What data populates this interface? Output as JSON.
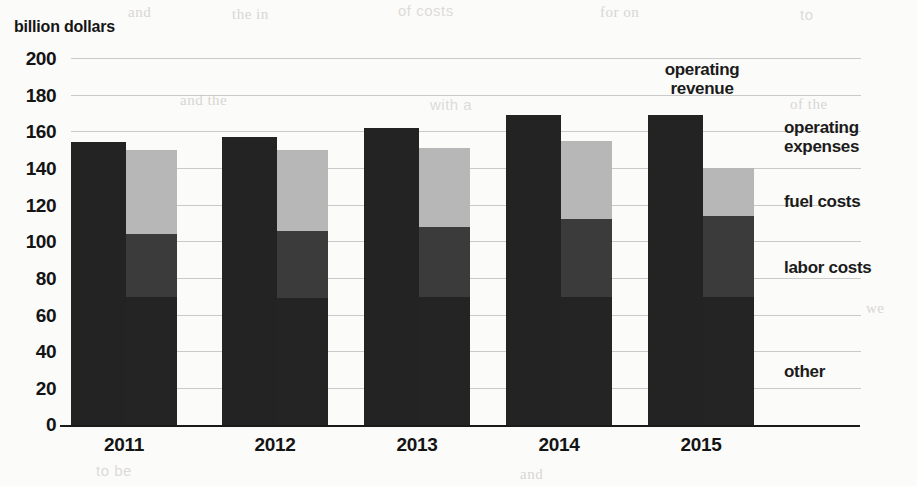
{
  "chart_data": {
    "type": "bar",
    "title": "",
    "subtitle": "",
    "ylabel": "billion dollars",
    "xlabel": "",
    "ylim": [
      0,
      200
    ],
    "ytick_step": 20,
    "yticks": [
      "200",
      "180",
      "160",
      "140",
      "120",
      "100",
      "80",
      "60",
      "40",
      "20",
      "0"
    ],
    "grid": true,
    "legend_position": "right-inline-labels",
    "categories": [
      "2011",
      "2012",
      "2013",
      "2014",
      "2015"
    ],
    "annotations": [
      {
        "text": "operating revenue",
        "line1": "operating",
        "line2": "revenue",
        "target": "2015 revenue bar"
      }
    ],
    "series": [
      {
        "name": "operating revenue",
        "color": "#232323",
        "stacked": false,
        "values": [
          154,
          157,
          162,
          169,
          169
        ]
      },
      {
        "name": "operating expenses",
        "color": "#b7b7b7",
        "stacked": true,
        "total": [
          150,
          150,
          151,
          155,
          140
        ],
        "components": [
          {
            "name": "other",
            "color": "#242424",
            "values": [
              70,
              69,
              70,
              70,
              70
            ]
          },
          {
            "name": "labor costs",
            "color": "#3b3b3b",
            "values": [
              34,
              37,
              38,
              42,
              44
            ]
          },
          {
            "name": "fuel costs",
            "color": "#b7b7b7",
            "values": [
              46,
              44,
              43,
              43,
              26
            ]
          }
        ]
      }
    ],
    "cumulative_tops": {
      "other": [
        70,
        69,
        70,
        70,
        70
      ],
      "labor_costs": [
        104,
        106,
        108,
        112,
        114
      ],
      "fuel_costs": [
        150,
        150,
        151,
        155,
        140
      ],
      "revenue": [
        154,
        157,
        162,
        169,
        169
      ]
    },
    "series_labels": [
      {
        "key": "operating_expenses",
        "line1": "operating",
        "line2": "expenses"
      },
      {
        "key": "fuel_costs",
        "line1": "fuel costs",
        "line2": ""
      },
      {
        "key": "labor_costs",
        "line1": "labor costs",
        "line2": ""
      },
      {
        "key": "other",
        "line1": "other",
        "line2": ""
      }
    ]
  },
  "ghost_text": [
    "and",
    "the",
    "in",
    "of",
    "for",
    "with",
    "a",
    "to",
    "and",
    "costs",
    "for",
    "on",
    "in the",
    "and",
    "to be",
    "of the",
    "that",
    "we"
  ]
}
